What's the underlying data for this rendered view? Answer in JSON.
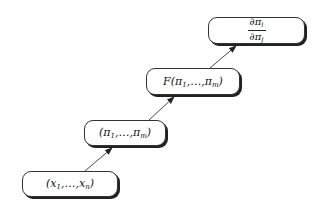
{
  "diagram": {
    "type": "flow",
    "direction": "bottom-left to top-right",
    "nodes": [
      {
        "id": "n1",
        "label": "(x1, …, xn)",
        "parts": {
          "open": "(",
          "var": "x",
          "sub1": "1",
          "sep": ",…,",
          "var2": "x",
          "sub2": "n",
          "close": ")"
        }
      },
      {
        "id": "n2",
        "label": "(π1, …, πm)",
        "parts": {
          "open": "(",
          "var": "π",
          "sub1": "1",
          "sep": ",…,",
          "var2": "π",
          "sub2": "m",
          "close": ")"
        }
      },
      {
        "id": "n3",
        "label": "F(π1, …, πm)",
        "parts": {
          "open": "F(",
          "var": "π",
          "sub1": "1",
          "sep": ",…,",
          "var2": "π",
          "sub2": "m",
          "close": ")"
        }
      },
      {
        "id": "n4",
        "label": "∂πi / ∂πj",
        "parts": {
          "num": "∂π",
          "num_sub": "i",
          "den": "∂π",
          "den_sub": "j"
        }
      }
    ],
    "edges": [
      {
        "from": "n1",
        "to": "n2"
      },
      {
        "from": "n2",
        "to": "n3"
      },
      {
        "from": "n3",
        "to": "n4"
      }
    ],
    "colors": {
      "stroke": "#333333",
      "shadow": "#222222",
      "fill": "#ffffff"
    }
  }
}
